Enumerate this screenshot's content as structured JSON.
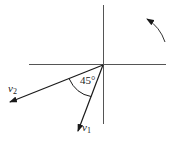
{
  "diagram": {
    "type": "vector-rotation",
    "axes": {
      "horizontal": true,
      "vertical": true
    },
    "angle_label": "45°",
    "vectors": [
      {
        "name": "v",
        "subscript": "1"
      },
      {
        "name": "v",
        "subscript": "2"
      }
    ],
    "rotation_indicator": "counterclockwise-arrow"
  },
  "colors": {
    "stroke": "#1a1a1a",
    "axis": "#555555",
    "background": "#ffffff"
  }
}
